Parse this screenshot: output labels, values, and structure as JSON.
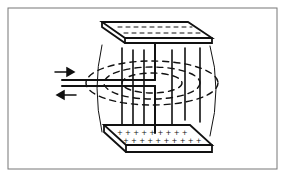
{
  "diagram": {
    "title": "",
    "colors": {
      "line": "#111111",
      "frame": "#555555",
      "background": "#ffffff"
    },
    "top_plate": {
      "charge_symbol": "-",
      "rows": 2
    },
    "bottom_plate": {
      "charge_symbol": "+",
      "rows": 2
    },
    "arrows": [
      {
        "direction": "right",
        "label": ""
      },
      {
        "direction": "left",
        "label": ""
      }
    ]
  }
}
